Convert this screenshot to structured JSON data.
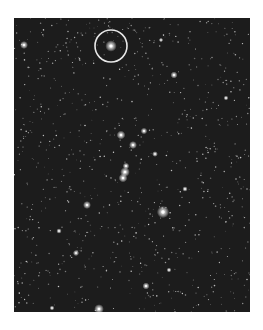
{
  "image": {
    "subject": "star-field photograph",
    "alt": "Black and white photograph of a dense star field with one star circled near the top",
    "background_color": "#ffffff",
    "sky_color": "#1c1c1c",
    "annotation_color": "#e8e8e8"
  },
  "annotation": {
    "type": "circle",
    "center": [
      97,
      28
    ],
    "radius": 16
  },
  "bright_stars": [
    {
      "x": 97,
      "y": 28,
      "r": 2.6
    },
    {
      "x": 10,
      "y": 27,
      "r": 1.8
    },
    {
      "x": 160,
      "y": 57,
      "r": 1.6
    },
    {
      "x": 147,
      "y": 22,
      "r": 1.0
    },
    {
      "x": 107,
      "y": 117,
      "r": 2.0
    },
    {
      "x": 119,
      "y": 127,
      "r": 1.8
    },
    {
      "x": 130,
      "y": 113,
      "r": 1.5
    },
    {
      "x": 141,
      "y": 136,
      "r": 1.3
    },
    {
      "x": 111,
      "y": 154,
      "r": 2.2
    },
    {
      "x": 109,
      "y": 160,
      "r": 2.0
    },
    {
      "x": 112,
      "y": 148,
      "r": 1.5
    },
    {
      "x": 149,
      "y": 194,
      "r": 2.8
    },
    {
      "x": 73,
      "y": 187,
      "r": 1.8
    },
    {
      "x": 171,
      "y": 171,
      "r": 1.2
    },
    {
      "x": 85,
      "y": 291,
      "r": 2.2
    },
    {
      "x": 132,
      "y": 268,
      "r": 1.6
    },
    {
      "x": 62,
      "y": 235,
      "r": 1.4
    },
    {
      "x": 45,
      "y": 213,
      "r": 1.2
    },
    {
      "x": 212,
      "y": 80,
      "r": 1.1
    },
    {
      "x": 213,
      "y": 296,
      "r": 1.2
    },
    {
      "x": 38,
      "y": 290,
      "r": 1.1
    },
    {
      "x": 155,
      "y": 252,
      "r": 1.1
    }
  ]
}
